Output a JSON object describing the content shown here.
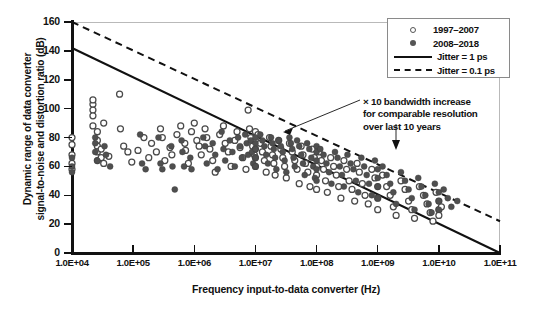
{
  "chart_data": {
    "type": "scatter",
    "title": "",
    "xlabel": "Frequency input-to-data converter (Hz)",
    "ylabel": "Dynamic range of data converter signal-to-noise and distortion ratio (dB)",
    "ylabel_line1": "Dynamic range of data converter",
    "ylabel_line2": "signal-to-noise and distortion ratio (dB)",
    "xscale": "log",
    "xlim": [
      10000,
      100000000000
    ],
    "ylim": [
      0,
      160
    ],
    "grid": false,
    "legend_position": "top-right",
    "xticks": [
      10000,
      100000,
      1000000,
      10000000,
      100000000,
      1000000000,
      10000000000,
      100000000000
    ],
    "xticklabels": [
      "1.0E+04",
      "1.0E+05",
      "1.0E+06",
      "1.0E+07",
      "1.0E+08",
      "1.0E+09",
      "1.0E+10",
      "1.0E+11"
    ],
    "yticks": [
      0,
      20,
      40,
      60,
      80,
      100,
      120,
      140,
      160
    ],
    "yticklabels": [
      "0",
      "20",
      "40",
      "60",
      "80",
      "100",
      "120",
      "140",
      "160"
    ],
    "legend": [
      {
        "label": "1997–2007",
        "marker": "open-circle",
        "color": "#555555"
      },
      {
        "label": "2008–2018",
        "marker": "filled-circle",
        "color": "#555555"
      },
      {
        "label": "Jitter = 1 ps",
        "marker": "solid-line",
        "color": "#111111"
      },
      {
        "label": "Jitter = 0.1 ps",
        "marker": "dashed-line",
        "color": "#111111"
      }
    ],
    "annotations": [
      {
        "text": "× 10 bandwidth increase for comparable resolution over last 10 years",
        "line1": "× 10 bandwidth increase",
        "line2": "for comparable resolution",
        "line3": "over last 10 years",
        "arrows": 2
      }
    ],
    "reference_lines": [
      {
        "name": "Jitter = 1 ps",
        "style": "solid",
        "x0": 10000,
        "y0": 142,
        "x1": 100000000000,
        "y1": 0
      },
      {
        "name": "Jitter = 0.1 ps",
        "style": "dashed",
        "x0": 10000,
        "y0": 160,
        "x1": 100000000000,
        "y1": 22
      }
    ],
    "series": [
      {
        "name": "1997–2007",
        "marker": "open-circle",
        "points": [
          [
            10000,
            80
          ],
          [
            10000,
            68
          ],
          [
            10000,
            62
          ],
          [
            10000,
            75
          ],
          [
            10000,
            58
          ],
          [
            22000,
            103
          ],
          [
            22000,
            99
          ],
          [
            22000,
            95
          ],
          [
            22000,
            106
          ],
          [
            22000,
            88
          ],
          [
            26000,
            84
          ],
          [
            26000,
            78
          ],
          [
            26000,
            74
          ],
          [
            26000,
            70
          ],
          [
            26000,
            64
          ],
          [
            30000,
            72
          ],
          [
            30000,
            66
          ],
          [
            33000,
            90
          ],
          [
            33000,
            62
          ],
          [
            40000,
            67
          ],
          [
            60000,
            110
          ],
          [
            62000,
            86
          ],
          [
            70000,
            74
          ],
          [
            82000,
            70
          ],
          [
            95000,
            63
          ],
          [
            120000,
            71
          ],
          [
            150000,
            80
          ],
          [
            180000,
            66
          ],
          [
            200000,
            76
          ],
          [
            240000,
            70
          ],
          [
            280000,
            86
          ],
          [
            300000,
            80
          ],
          [
            330000,
            64
          ],
          [
            400000,
            73
          ],
          [
            430000,
            68
          ],
          [
            520000,
            82
          ],
          [
            600000,
            88
          ],
          [
            700000,
            76
          ],
          [
            720000,
            71
          ],
          [
            800000,
            62
          ],
          [
            900000,
            84
          ],
          [
            1000000,
            90
          ],
          [
            1100000,
            78
          ],
          [
            1200000,
            74
          ],
          [
            1300000,
            68
          ],
          [
            1500000,
            86
          ],
          [
            1600000,
            80
          ],
          [
            1800000,
            72
          ],
          [
            2000000,
            64
          ],
          [
            2200000,
            56
          ],
          [
            2600000,
            82
          ],
          [
            3000000,
            88
          ],
          [
            3200000,
            76
          ],
          [
            3600000,
            70
          ],
          [
            4000000,
            60
          ],
          [
            4600000,
            78
          ],
          [
            5000000,
            84
          ],
          [
            5600000,
            73
          ],
          [
            6200000,
            66
          ],
          [
            7000000,
            58
          ],
          [
            7600000,
            99
          ],
          [
            8000000,
            86
          ],
          [
            8400000,
            80
          ],
          [
            9000000,
            74
          ],
          [
            9600000,
            68
          ],
          [
            10000000,
            84
          ],
          [
            10000000,
            78
          ],
          [
            10000000,
            72
          ],
          [
            10000000,
            66
          ],
          [
            10000000,
            60
          ],
          [
            11000000,
            82
          ],
          [
            12000000,
            76
          ],
          [
            13000000,
            70
          ],
          [
            14000000,
            64
          ],
          [
            15000000,
            56
          ],
          [
            17000000,
            80
          ],
          [
            18000000,
            74
          ],
          [
            19000000,
            68
          ],
          [
            20000000,
            62
          ],
          [
            21000000,
            54
          ],
          [
            24000000,
            78
          ],
          [
            26000000,
            72
          ],
          [
            28000000,
            66
          ],
          [
            30000000,
            60
          ],
          [
            32000000,
            52
          ],
          [
            36000000,
            76
          ],
          [
            40000000,
            70
          ],
          [
            44000000,
            64
          ],
          [
            48000000,
            58
          ],
          [
            52000000,
            48
          ],
          [
            56000000,
            74
          ],
          [
            60000000,
            68
          ],
          [
            66000000,
            62
          ],
          [
            72000000,
            56
          ],
          [
            78000000,
            46
          ],
          [
            85000000,
            72
          ],
          [
            92000000,
            66
          ],
          [
            100000000,
            60
          ],
          [
            100000000,
            54
          ],
          [
            100000000,
            44
          ],
          [
            110000000,
            70
          ],
          [
            120000000,
            64
          ],
          [
            130000000,
            58
          ],
          [
            140000000,
            50
          ],
          [
            150000000,
            42
          ],
          [
            170000000,
            66
          ],
          [
            190000000,
            60
          ],
          [
            210000000,
            54
          ],
          [
            230000000,
            46
          ],
          [
            250000000,
            38
          ],
          [
            280000000,
            64
          ],
          [
            310000000,
            58
          ],
          [
            340000000,
            50
          ],
          [
            380000000,
            44
          ],
          [
            420000000,
            36
          ],
          [
            460000000,
            62
          ],
          [
            500000000,
            56
          ],
          [
            560000000,
            48
          ],
          [
            620000000,
            40
          ],
          [
            700000000,
            34
          ],
          [
            800000000,
            58
          ],
          [
            900000000,
            52
          ],
          [
            1000000000,
            46
          ],
          [
            1000000000,
            38
          ],
          [
            1000000000,
            30
          ],
          [
            1200000000,
            54
          ],
          [
            1400000000,
            46
          ],
          [
            1600000000,
            40
          ],
          [
            1800000000,
            32
          ],
          [
            2000000000,
            26
          ],
          [
            2400000000,
            50
          ],
          [
            2800000000,
            44
          ],
          [
            3200000000,
            36
          ],
          [
            3600000000,
            30
          ],
          [
            4000000000,
            24
          ],
          [
            4800000000,
            46
          ],
          [
            5600000000,
            40
          ],
          [
            6400000000,
            34
          ],
          [
            7200000000,
            28
          ],
          [
            8000000000,
            22
          ],
          [
            9000000000,
            42
          ],
          [
            10000000000,
            36
          ],
          [
            10000000000,
            30
          ],
          [
            10000000000,
            26
          ],
          [
            11000000000,
            32
          ]
        ]
      },
      {
        "name": "2008–2018",
        "marker": "filled-circle",
        "points": [
          [
            10000,
            66
          ],
          [
            10000,
            60
          ],
          [
            10000,
            56
          ],
          [
            24000,
            80
          ],
          [
            24000,
            76
          ],
          [
            24000,
            70
          ],
          [
            26000,
            64
          ],
          [
            34000,
            74
          ],
          [
            36000,
            68
          ],
          [
            42000,
            60
          ],
          [
            130000,
            82
          ],
          [
            140000,
            62
          ],
          [
            160000,
            58
          ],
          [
            260000,
            80
          ],
          [
            280000,
            62
          ],
          [
            300000,
            58
          ],
          [
            420000,
            74
          ],
          [
            440000,
            60
          ],
          [
            480000,
            44
          ],
          [
            620000,
            78
          ],
          [
            640000,
            70
          ],
          [
            680000,
            60
          ],
          [
            860000,
            66
          ],
          [
            900000,
            58
          ],
          [
            1400000,
            80
          ],
          [
            1500000,
            74
          ],
          [
            1600000,
            62
          ],
          [
            2000000,
            76
          ],
          [
            2200000,
            68
          ],
          [
            2400000,
            58
          ],
          [
            2800000,
            84
          ],
          [
            3000000,
            72
          ],
          [
            3200000,
            64
          ],
          [
            3800000,
            78
          ],
          [
            4200000,
            70
          ],
          [
            4600000,
            60
          ],
          [
            5200000,
            80
          ],
          [
            5600000,
            74
          ],
          [
            6000000,
            66
          ],
          [
            6800000,
            82
          ],
          [
            7200000,
            76
          ],
          [
            7600000,
            68
          ],
          [
            8400000,
            78
          ],
          [
            8800000,
            70
          ],
          [
            9200000,
            62
          ],
          [
            10000000,
            80
          ],
          [
            10000000,
            76
          ],
          [
            10000000,
            72
          ],
          [
            10000000,
            66
          ],
          [
            10000000,
            60
          ],
          [
            12000000,
            82
          ],
          [
            13000000,
            78
          ],
          [
            14000000,
            74
          ],
          [
            15000000,
            68
          ],
          [
            16000000,
            62
          ],
          [
            18000000,
            80
          ],
          [
            19000000,
            76
          ],
          [
            20000000,
            72
          ],
          [
            21000000,
            66
          ],
          [
            22000000,
            58
          ],
          [
            24000000,
            78
          ],
          [
            26000000,
            74
          ],
          [
            28000000,
            70
          ],
          [
            30000000,
            64
          ],
          [
            32000000,
            56
          ],
          [
            36000000,
            80
          ],
          [
            38000000,
            76
          ],
          [
            40000000,
            72
          ],
          [
            42000000,
            66
          ],
          [
            44000000,
            60
          ],
          [
            48000000,
            78
          ],
          [
            52000000,
            74
          ],
          [
            56000000,
            68
          ],
          [
            60000000,
            62
          ],
          [
            64000000,
            54
          ],
          [
            70000000,
            76
          ],
          [
            76000000,
            72
          ],
          [
            82000000,
            66
          ],
          [
            88000000,
            60
          ],
          [
            94000000,
            52
          ],
          [
            100000000,
            74
          ],
          [
            100000000,
            70
          ],
          [
            100000000,
            64
          ],
          [
            100000000,
            58
          ],
          [
            100000000,
            50
          ],
          [
            115000000,
            72
          ],
          [
            130000000,
            68
          ],
          [
            145000000,
            62
          ],
          [
            160000000,
            56
          ],
          [
            175000000,
            48
          ],
          [
            200000000,
            70
          ],
          [
            220000000,
            66
          ],
          [
            240000000,
            60
          ],
          [
            260000000,
            54
          ],
          [
            280000000,
            46
          ],
          [
            320000000,
            68
          ],
          [
            360000000,
            62
          ],
          [
            400000000,
            58
          ],
          [
            440000000,
            50
          ],
          [
            480000000,
            42
          ],
          [
            540000000,
            66
          ],
          [
            600000000,
            60
          ],
          [
            660000000,
            54
          ],
          [
            720000000,
            48
          ],
          [
            800000000,
            40
          ],
          [
            900000000,
            64
          ],
          [
            1000000000,
            58
          ],
          [
            1000000000,
            52
          ],
          [
            1000000000,
            46
          ],
          [
            1000000000,
            38
          ],
          [
            1200000000,
            60
          ],
          [
            1400000000,
            54
          ],
          [
            1600000000,
            48
          ],
          [
            1800000000,
            42
          ],
          [
            2000000000,
            34
          ],
          [
            2400000000,
            56
          ],
          [
            2800000000,
            50
          ],
          [
            3200000000,
            44
          ],
          [
            3600000000,
            38
          ],
          [
            4000000000,
            30
          ],
          [
            4600000000,
            52
          ],
          [
            5200000000,
            46
          ],
          [
            6000000000,
            40
          ],
          [
            6800000000,
            34
          ],
          [
            7600000000,
            28
          ],
          [
            8600000000,
            48
          ],
          [
            10000000000,
            42
          ],
          [
            10000000000,
            36
          ],
          [
            10000000000,
            30
          ],
          [
            12000000000,
            44
          ],
          [
            14000000000,
            38
          ],
          [
            16000000000,
            32
          ],
          [
            20000000000,
            36
          ]
        ]
      }
    ]
  }
}
